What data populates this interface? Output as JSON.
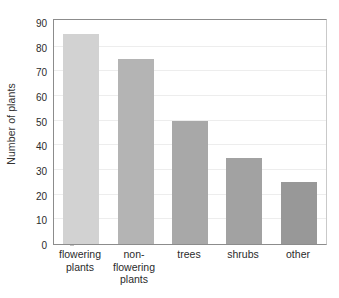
{
  "chart_data": {
    "type": "bar",
    "title": "",
    "xlabel": "",
    "ylabel": "Number of plants",
    "categories": [
      "flowering plants",
      "non-flowering plants",
      "trees",
      "shrubs",
      "other"
    ],
    "values": [
      85,
      75,
      50,
      35,
      25
    ],
    "ylim": [
      0,
      90
    ],
    "ytick_labels": [
      "0",
      "10",
      "20",
      "30",
      "40",
      "50",
      "60",
      "70",
      "80",
      "90"
    ],
    "ytick_values": [
      0,
      10,
      20,
      30,
      40,
      50,
      60,
      70,
      80,
      90
    ],
    "grid": true,
    "legend": "none",
    "bar_colors": [
      "#d2d2d2",
      "#b4b4b4",
      "#a8a8a8",
      "#a2a2a2",
      "#989898"
    ],
    "series": [
      {
        "name": "Number of plants",
        "values": [
          85,
          75,
          50,
          35,
          25
        ]
      }
    ],
    "points": [
      {
        "category": "flowering plants",
        "value": 85,
        "color": "#d2d2d2"
      },
      {
        "category": "non-flowering plants",
        "value": 75,
        "color": "#b4b4b4"
      },
      {
        "category": "trees",
        "value": 50,
        "color": "#a8a8a8"
      },
      {
        "category": "shrubs",
        "value": 35,
        "color": "#a2a2a2"
      },
      {
        "category": "other",
        "value": 25,
        "color": "#989898"
      }
    ]
  },
  "axes": {
    "y_axis_title": "Number of plants",
    "y_min": 0,
    "y_max": 90,
    "y_step": 10,
    "axis_color": "#8c8c8c",
    "gridline_color": "#ededed"
  },
  "figure": {
    "background": "#ffffff",
    "cropped_title_text": ""
  }
}
